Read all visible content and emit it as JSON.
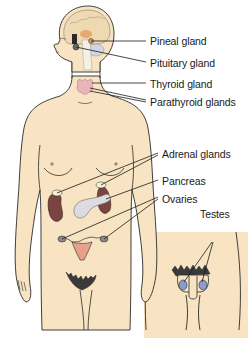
{
  "diagram": {
    "colors": {
      "skin": "#f8e4c3",
      "outline": "#2a2a2a",
      "brain": "#efd9b3",
      "pineal": "#e8a870",
      "thyroid": "#e9b5b8",
      "kidney": "#7a4540",
      "adrenal": "#f4f1d6",
      "pancreas": "#dcdbe0",
      "uterus": "#e8a08a",
      "testes": "#8a9bd0",
      "leader_line": "#1a1a1a"
    },
    "labels": [
      {
        "id": "pineal",
        "text": "Pineal gland"
      },
      {
        "id": "pituitary",
        "text": "Pituitary gland"
      },
      {
        "id": "thyroid",
        "text": "Thyroid gland"
      },
      {
        "id": "parathyroid",
        "text": "Parathyroid glands"
      },
      {
        "id": "adrenal",
        "text": "Adrenal glands"
      },
      {
        "id": "pancreas",
        "text": "Pancreas"
      },
      {
        "id": "ovaries",
        "text": "Ovaries"
      },
      {
        "id": "testes",
        "text": "Testes"
      }
    ]
  }
}
